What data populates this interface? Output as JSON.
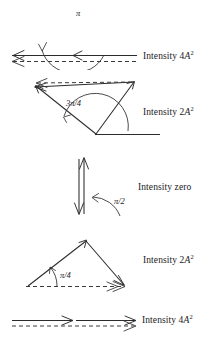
{
  "figure": {
    "width": 215,
    "height": 353,
    "background": "#ffffff",
    "stroke_color": "#2b2b2b",
    "dashed_color": "#3a3a3a"
  },
  "rows": [
    {
      "id": "row-1",
      "phase_label": "",
      "phase_symbol": "π",
      "intensity_prefix": "Intensity 4",
      "intensity_symbol": "A",
      "intensity_exponent": "2",
      "intensity_full": "Intensity 4A2",
      "description": "Two antiparallel phasors pointing left, dashed resultant arrow to the left",
      "phasor_count": 2,
      "resultant": "dashed left arrow"
    },
    {
      "id": "row-2",
      "phase_label": "",
      "phase_symbol": "3π/4",
      "phase_numerator": "3",
      "phase_denominator": "4",
      "intensity_prefix": "Intensity 2",
      "intensity_symbol": "A",
      "intensity_exponent": "2",
      "intensity_full": "Intensity 2A2",
      "description": "Two phasors at 3π/4 forming a V, dashed resultant arrow to the upper left",
      "phasor_count": 2,
      "resultant": "dashed left arrow"
    },
    {
      "id": "row-3",
      "phase_label": "",
      "phase_symbol": "π/2",
      "intensity_prefix": "Intensity zero",
      "intensity_symbol": "",
      "intensity_exponent": "",
      "intensity_full": "Intensity zero",
      "description": "Two antiparallel vertical phasors, zero resultant",
      "phasor_count": 2,
      "resultant": "none"
    },
    {
      "id": "row-4",
      "phase_label": "",
      "phase_symbol": "π/4",
      "intensity_prefix": "Intensity 2",
      "intensity_symbol": "A",
      "intensity_exponent": "2",
      "intensity_full": "Intensity 2A2",
      "description": "Two phasors at π/4 forming a triangle, dashed horizontal resultant to the right",
      "phasor_count": 2,
      "resultant": "dashed right arrow"
    },
    {
      "id": "row-5",
      "phase_label": "",
      "phase_symbol": "",
      "intensity_prefix": "Intensity 4",
      "intensity_symbol": "A",
      "intensity_exponent": "2",
      "intensity_full": "Intensity 4A2",
      "description": "Two collinear phasors pointing right, dashed resultant arrow to the right",
      "phasor_count": 2,
      "resultant": "dashed right arrow"
    }
  ]
}
